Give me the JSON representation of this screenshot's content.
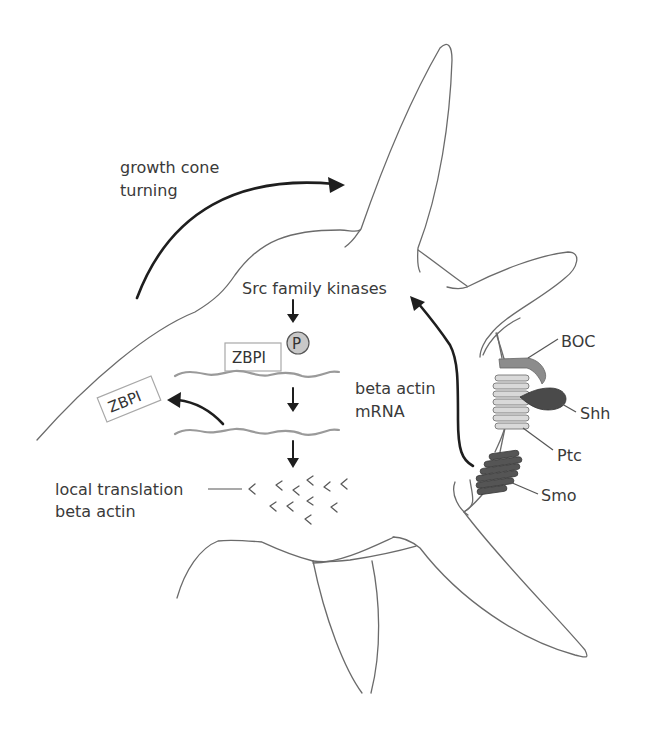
{
  "labels": {
    "growth_cone_line1": "growth cone",
    "growth_cone_line2": "turning",
    "src_kinases": "Src family kinases",
    "zbp1_bound": "ZBPI",
    "phospho": "P",
    "zbp1_released": "ZBPI",
    "beta_actin_line1": "beta actin",
    "beta_actin_line2": "mRNA",
    "local_translation_line1": "local translation",
    "local_translation_line2": "beta actin",
    "boc": "BOC",
    "shh": "Shh",
    "ptc": "Ptc",
    "smo": "Smo"
  },
  "colors": {
    "outline": "#6b6b6b",
    "arrow": "#1e1e1e",
    "mrna": "#9a9a9a",
    "boc": "#8c8c8c",
    "shh": "#4a4a4a",
    "ptc": "#d9d9d9",
    "smo": "#555555",
    "phospho_fill": "#c8c8c8"
  }
}
